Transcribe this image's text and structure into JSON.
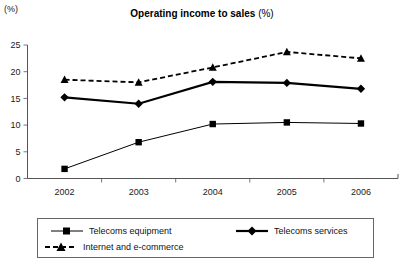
{
  "chart_data": {
    "type": "line",
    "title": "Operating income to sales",
    "title_suffix": "(%)",
    "ylabel": "(%)",
    "xlabel": "",
    "categories": [
      "2002",
      "2003",
      "2004",
      "2005",
      "2006"
    ],
    "ylim": [
      0,
      25
    ],
    "yticks": [
      "0",
      "5",
      "10",
      "15",
      "20",
      "25"
    ],
    "grid": false,
    "legend_position": "bottom",
    "series": [
      {
        "name": "Telecoms equipment",
        "marker": "square",
        "line_style": "solid-thin",
        "values": [
          1.8,
          6.8,
          10.2,
          10.5,
          10.3
        ]
      },
      {
        "name": "Telecoms  services",
        "marker": "diamond",
        "line_style": "solid-thick",
        "values": [
          15.2,
          14.0,
          18.1,
          17.9,
          16.8
        ]
      },
      {
        "name": "Internet and e-commerce",
        "marker": "triangle",
        "line_style": "dashed",
        "values": [
          18.5,
          18.0,
          20.8,
          23.7,
          22.5
        ]
      }
    ]
  }
}
